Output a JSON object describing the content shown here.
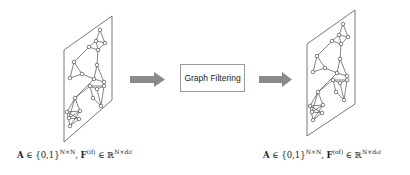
{
  "diagram": {
    "process_box": {
      "label": "Graph Filtering"
    },
    "input_label": {
      "A": "A",
      "in": " ∈ {0,1}",
      "A_sup": "N×N",
      "comma": ", ",
      "F": "F",
      "F_sup": "(if)",
      "in2": " ∈ ℝ",
      "R_sup": "N×d",
      "R_sub": "if"
    },
    "output_label": {
      "A": "A",
      "in": " ∈ {0,1}",
      "A_sup": "N×N",
      "comma": ", ",
      "F": "F",
      "F_sup": "(of)",
      "in2": " ∈ ℝ",
      "R_sup": "N×d",
      "R_sub": "of"
    },
    "colors": {
      "arrow": "#8a8a8a",
      "plane_stroke": "#555555",
      "edge": "#333333",
      "node_fill": "#ffffff",
      "box_border": "#9a9a9a"
    }
  }
}
